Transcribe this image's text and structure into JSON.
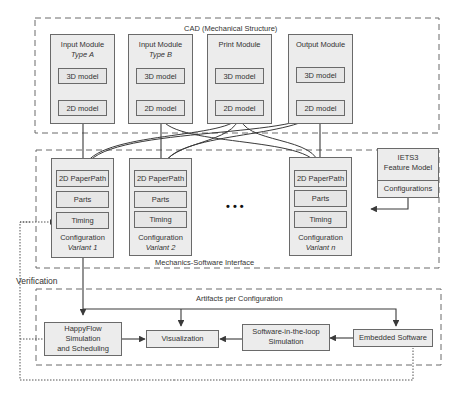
{
  "cad": {
    "title": "CAD (Mechanical Structure)",
    "modules": [
      {
        "name": "Input Module",
        "type": "Type A",
        "model3d": "3D model",
        "model2d": "2D model"
      },
      {
        "name": "Input Module",
        "type": "Type B",
        "model3d": "3D model",
        "model2d": "2D model"
      },
      {
        "name": "Print Module",
        "type": "",
        "model3d": "3D model",
        "model2d": "2D model"
      },
      {
        "name": "Output Module",
        "type": "",
        "model3d": "3D model",
        "model2d": "2D model"
      }
    ]
  },
  "interface": {
    "title": "Mechanics-Software Interface",
    "configurations": [
      {
        "paperpath": "2D PaperPath",
        "parts": "Parts",
        "timing": "Timing",
        "label": "Configuration",
        "variant": "Variant 1"
      },
      {
        "paperpath": "2D PaperPath",
        "parts": "Parts",
        "timing": "Timing",
        "label": "Configuration",
        "variant": "Variant 2"
      },
      {
        "paperpath": "2D PaperPath",
        "parts": "Parts",
        "timing": "Timing",
        "label": "Configuration",
        "variant": "Variant n"
      }
    ],
    "ellipsis": "• • •"
  },
  "feature_model": {
    "title_line1": "IETS3",
    "title_line2": "Feature Model",
    "configurations": "Configurations"
  },
  "verification": {
    "label": "Verification"
  },
  "artifacts": {
    "title": "Artifacts per Configuration",
    "happyflow_line1": "HappyFlow",
    "happyflow_line2": "Simulation",
    "happyflow_line3": "and Scheduling",
    "visualization": "Visualization",
    "sil_line1": "Software-in-the-loop",
    "sil_line2": "Simulation",
    "embedded": "Embedded Software"
  },
  "colors": {
    "box_fill": "#ececec",
    "inner_fill": "#e6e6e6",
    "stroke": "#6a6a6a",
    "arrow": "#3a3a3a"
  }
}
